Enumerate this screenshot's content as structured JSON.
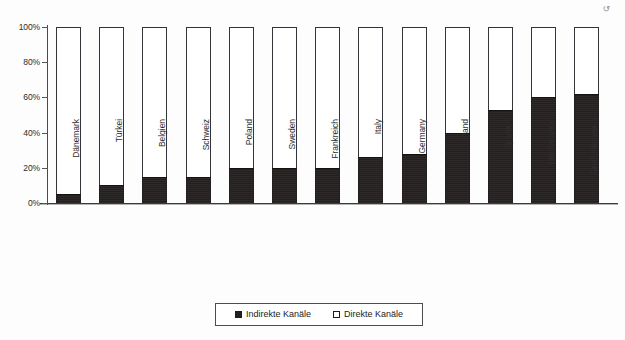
{
  "chart_data": {
    "type": "bar",
    "subtype": "stacked-100-percent",
    "title": "",
    "subtitle": "",
    "xlabel": "",
    "ylabel": "",
    "ylim": [
      0,
      100
    ],
    "yticks": [
      "0%",
      "20%",
      "40%",
      "60%",
      "80%",
      "100%"
    ],
    "ytick_values": [
      0,
      20,
      40,
      60,
      80,
      100
    ],
    "grid": false,
    "legend_position": "bottom-center",
    "categories": [
      "Dänemark",
      "Türkei",
      "Belgien",
      "Schweiz",
      "Poland",
      "Sweden",
      "Frankreich",
      "Italy",
      "Germany",
      "Irland",
      "Spanien",
      "Niederlande",
      "Großbritannien"
    ],
    "series": [
      {
        "name": "Indirekte Kanäle",
        "color": "#241f1f",
        "values": [
          5,
          10,
          15,
          15,
          20,
          20,
          20,
          26,
          28,
          40,
          53,
          60,
          62
        ]
      },
      {
        "name": "Direkte Kanäle",
        "color": "#ffffff",
        "values": [
          95,
          90,
          85,
          85,
          80,
          80,
          80,
          74,
          72,
          60,
          47,
          40,
          38
        ]
      }
    ],
    "annotations": []
  },
  "legend": {
    "entries": [
      {
        "label": "Indirekte Kanäle",
        "swatch": "filled-square-icon"
      },
      {
        "label": "Direkte Kanäle",
        "swatch": "open-square-icon"
      }
    ]
  },
  "artifact": {
    "mark": "↺"
  }
}
